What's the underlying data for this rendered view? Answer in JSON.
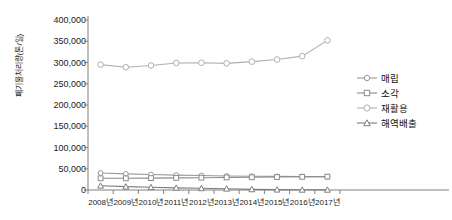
{
  "chart_data": {
    "type": "line",
    "title": "",
    "xlabel": "",
    "ylabel": "폐기물처리량(톤/일)",
    "ylim": [
      0,
      400000
    ],
    "ytick_labels": [
      "400,000",
      "350,000",
      "300,000",
      "250,000",
      "200,000",
      "150,000",
      "100,000",
      "50,000",
      "0"
    ],
    "ytick_values": [
      400000,
      350000,
      300000,
      250000,
      200000,
      150000,
      100000,
      50000,
      0
    ],
    "grid": false,
    "legend_position": "right",
    "categories": [
      "2008년",
      "2009년",
      "2010년",
      "2011년",
      "2012년",
      "2013년",
      "2014년",
      "2015년",
      "2016년",
      "2017년"
    ],
    "series": [
      {
        "name": "매립",
        "marker": "circle",
        "color": "#9a9a9a",
        "values": [
          40000,
          38000,
          36500,
          35000,
          34000,
          33000,
          32500,
          32000,
          31500,
          31000
        ]
      },
      {
        "name": "소각",
        "marker": "square",
        "color": "#8c8c8c",
        "values": [
          27500,
          27500,
          28000,
          28500,
          29000,
          29500,
          30000,
          30500,
          31000,
          31500
        ]
      },
      {
        "name": "재활용",
        "marker": "circle",
        "color": "#b0b0b0",
        "values": [
          295000,
          289000,
          293000,
          299000,
          299500,
          298000,
          302000,
          307000,
          315000,
          352000
        ]
      },
      {
        "name": "해역배출",
        "marker": "triangle",
        "color": "#7d7d7d",
        "values": [
          10000,
          8000,
          6500,
          5000,
          4000,
          3000,
          1500,
          800,
          500,
          400
        ]
      }
    ]
  },
  "axis": {
    "y_title": "폐기물처리량(톤/일)"
  }
}
